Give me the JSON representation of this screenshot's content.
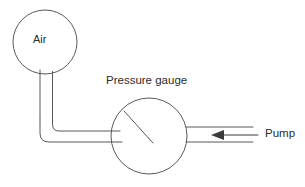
{
  "diagram": {
    "stroke_color": "#595959",
    "text_color": "#2b2b2b",
    "background_color": "#ffffff",
    "labels": {
      "air": "Air",
      "pressure_gauge": "Pressure gauge",
      "pump": "Pump"
    },
    "components": {
      "balloon": {
        "name": "air-balloon",
        "shape": "circle",
        "cx": 45,
        "cy": 42,
        "r": 32
      },
      "balloon_neck": {
        "name": "balloon-neck",
        "shape": "tube",
        "x_left": 40,
        "x_right": 52,
        "y_top": 72,
        "y_bottom": 110
      },
      "tube_elbow": {
        "name": "connecting-tube",
        "shape": "elbow-tube",
        "corner_radius": 10,
        "y_outer": 142,
        "y_inner": 131,
        "x_end": 122
      },
      "gauge": {
        "name": "pressure-gauge-dial",
        "shape": "circle",
        "cx": 149,
        "cy": 136,
        "r": 38
      },
      "gauge_needle": {
        "name": "gauge-needle",
        "shape": "line",
        "x1": 124,
        "y1": 111,
        "x2": 152,
        "y2": 142
      },
      "pump_tube": {
        "name": "pump-tube",
        "shape": "tube",
        "x_start": 187,
        "x_end": 253,
        "y_top": 127,
        "y_bottom": 142
      },
      "pump_arrow": {
        "name": "pump-flow-arrow",
        "direction": "left",
        "x_tail": 256,
        "x_head": 213,
        "y": 135
      }
    }
  }
}
